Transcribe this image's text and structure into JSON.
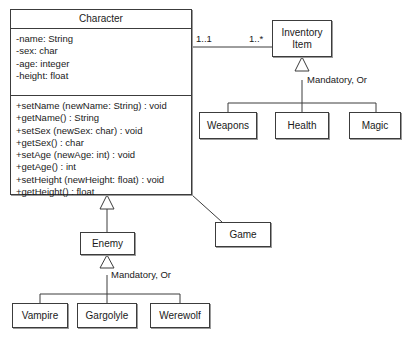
{
  "diagram": {
    "kind": "uml-class-diagram",
    "colors": {
      "stroke": "#3c3c3c",
      "fill": "#ffffff",
      "text": "#1a1a1a",
      "shadow": "#9a9a9a"
    },
    "classes": {
      "character": {
        "name": "Character",
        "attributes": [
          "-name: String",
          "-sex: char",
          "-age: integer",
          "-height: float"
        ],
        "methods": [
          "+setName (newName: String) : void",
          "+getName() : String",
          "+setSex (newSex: char) : void",
          "+getSex() : char",
          "+setAge (newAge: int) : void",
          "+getAge() : int",
          "+setHeight (newHeight: float) : void",
          "+getHeight() : float"
        ]
      },
      "inventory_item": {
        "name": "Inventory\nItem"
      },
      "weapons": {
        "name": "Weapons"
      },
      "health": {
        "name": "Health"
      },
      "magic": {
        "name": "Magic"
      },
      "game": {
        "name": "Game"
      },
      "enemy": {
        "name": "Enemy"
      },
      "vampire": {
        "name": "Vampire"
      },
      "gargolyle": {
        "name": "Gargolyle"
      },
      "werewolf": {
        "name": "Werewolf"
      }
    },
    "labels": {
      "multiplicity_character_end": "1..1",
      "multiplicity_inventory_end": "1..*",
      "constraint_inventory": "Mandatory, Or",
      "constraint_enemy": "Mandatory, Or"
    }
  }
}
